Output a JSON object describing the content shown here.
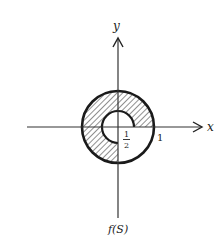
{
  "figure": {
    "caption": "f(S)",
    "axes": {
      "x_label": "x",
      "y_label": "y"
    },
    "region": {
      "description": "Annulus between radius 1/2 and 1, with the lower-right quadrant filled to the center",
      "outer_radius_label": "1",
      "inner_radius_label_num": "1",
      "inner_radius_label_den": "2",
      "fill": "hatched"
    },
    "colors": {
      "stroke": "#1a1a1a",
      "background": "#ffffff"
    }
  }
}
